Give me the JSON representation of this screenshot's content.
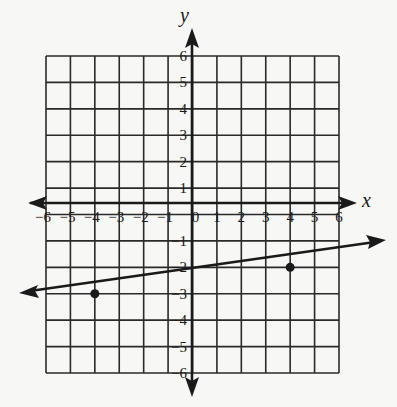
{
  "chart_data": {
    "type": "line",
    "title": "",
    "xlabel": "x",
    "ylabel": "y",
    "xlim": [
      -6,
      6
    ],
    "ylim": [
      -6,
      6
    ],
    "grid": true,
    "x_ticks": [
      "-6",
      "-5",
      "-4",
      "-3",
      "-2",
      "-1",
      "0",
      "1",
      "2",
      "3",
      "4",
      "5",
      "6"
    ],
    "y_ticks": [
      "6",
      "5",
      "4",
      "3",
      "2",
      "1",
      "-1",
      "-2",
      "-3",
      "-4",
      "-5",
      "-6"
    ],
    "points": [
      {
        "x": -4,
        "y": -3
      },
      {
        "x": 4,
        "y": -2
      }
    ],
    "line": {
      "slope": 0.125,
      "intercept": -2.5,
      "arrows_both_ends": true
    }
  },
  "axes": {
    "x_label": "x",
    "y_label": "y",
    "origin_label": "0"
  },
  "colors": {
    "ink": "#1a1a1a",
    "grid": "#2a2a2a",
    "background": "#f7f7f5"
  }
}
